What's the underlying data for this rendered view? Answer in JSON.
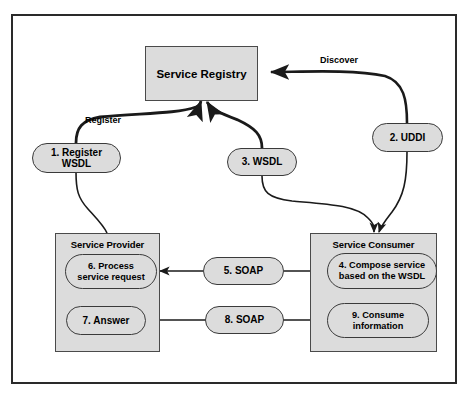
{
  "diagram": {
    "frame": {
      "border_color": "#2a2a2a",
      "background": "#ffffff"
    },
    "palette": {
      "node_fill": "#dcdcdc",
      "node_stroke": "#4a4a4a",
      "wire": "#1a1a1a",
      "text": "#000000"
    },
    "containers": [
      {
        "id": "service-registry",
        "label": "Service Registry",
        "shape": "rectangle"
      },
      {
        "id": "service-provider",
        "label": "Service Provider",
        "shape": "rectangle"
      },
      {
        "id": "service-consumer",
        "label": "Service Consumer",
        "shape": "rectangle"
      }
    ],
    "steps": [
      {
        "id": "step-1",
        "number": "1.",
        "label": "1. Register\nWSDL",
        "line1": "1. Register",
        "line2": "WSDL"
      },
      {
        "id": "step-2",
        "number": "2.",
        "label": "2. UDDI",
        "line1": "2. UDDI",
        "line2": ""
      },
      {
        "id": "step-3",
        "number": "3.",
        "label": "3. WSDL",
        "line1": "3. WSDL",
        "line2": ""
      },
      {
        "id": "step-4",
        "number": "4.",
        "label": "4. Compose service based on the WSDL",
        "line1": "4. Compose service",
        "line2": "based on the WSDL"
      },
      {
        "id": "step-5",
        "number": "5.",
        "label": "5. SOAP",
        "line1": "5. SOAP",
        "line2": ""
      },
      {
        "id": "step-6",
        "number": "6.",
        "label": "6. Process service request",
        "line1": "6. Process",
        "line2": "service request"
      },
      {
        "id": "step-7",
        "number": "7.",
        "label": "7. Answer",
        "line1": "7. Answer",
        "line2": ""
      },
      {
        "id": "step-8",
        "number": "8.",
        "label": "8. SOAP",
        "line1": "8. SOAP",
        "line2": ""
      },
      {
        "id": "step-9",
        "number": "9.",
        "label": "9. Consume information",
        "line1": "9. Consume",
        "line2": "information"
      }
    ],
    "edge_labels": [
      {
        "id": "edge-register",
        "label": "Register"
      },
      {
        "id": "edge-discover",
        "label": "Discover"
      }
    ],
    "connections": [
      {
        "from": "step-1",
        "to": "service-registry",
        "label": "Register",
        "arrow": "to"
      },
      {
        "from": "step-2",
        "to": "service-registry",
        "label": "Discover",
        "arrow": "to"
      },
      {
        "from": "step-3",
        "to": "service-registry",
        "label": "",
        "arrow": "to"
      },
      {
        "from": "step-1",
        "to": "service-provider",
        "label": "",
        "arrow": "none"
      },
      {
        "from": "step-3",
        "to": "service-consumer",
        "label": "",
        "arrow": "to"
      },
      {
        "from": "step-2",
        "to": "service-consumer",
        "label": "",
        "arrow": "to"
      },
      {
        "from": "step-4",
        "to": "step-6",
        "via": "step-5",
        "label": "5. SOAP",
        "arrow": "to"
      },
      {
        "from": "step-7",
        "to": "step-9",
        "via": "step-8",
        "label": "8. SOAP",
        "arrow": "to"
      }
    ]
  }
}
